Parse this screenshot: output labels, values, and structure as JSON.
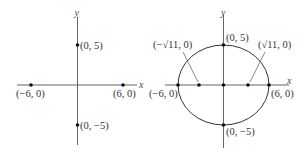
{
  "colors": {
    "axis": "#555555",
    "curve": "#333333",
    "point": "#111111",
    "text": "#333333"
  },
  "left_diagram": {
    "x_axis_label": "x",
    "y_axis_label": "y",
    "points": [
      {
        "label": "(0, 5)",
        "x": 0,
        "y": 5
      },
      {
        "label": "(−6, 0)",
        "x": -6,
        "y": 0
      },
      {
        "label": "(6, 0)",
        "x": 6,
        "y": 0
      },
      {
        "label": "(0, −5)",
        "x": 0,
        "y": -5
      }
    ]
  },
  "right_diagram": {
    "x_axis_label": "x",
    "y_axis_label": "y",
    "curve": "ellipse x²/36 + y²/25 = 1",
    "points": [
      {
        "label": "(0, 5)",
        "x": 0,
        "y": 5
      },
      {
        "label": "(−√11, 0)",
        "x": -3.317,
        "y": 0
      },
      {
        "label": "(√11, 0)",
        "x": 3.317,
        "y": 0
      },
      {
        "label": "(−6, 0)",
        "x": -6,
        "y": 0
      },
      {
        "label": "(6, 0)",
        "x": 6,
        "y": 0
      },
      {
        "label": "(0, −5)",
        "x": 0,
        "y": -5
      },
      {
        "label": "",
        "x": 0,
        "y": 0
      }
    ]
  }
}
